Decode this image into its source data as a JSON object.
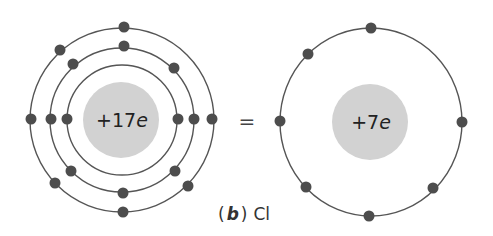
{
  "figure": {
    "caption": {
      "open_paren": "(",
      "part_letter": "b",
      "close_paren": ")",
      "element": "Cl"
    },
    "equals": "=",
    "left_atom": {
      "description": "Full chlorine atom with three electron shells",
      "nucleus_charge_prefix": "+17",
      "nucleus_charge_unit": "e",
      "shells": [
        {
          "name": "inner",
          "electrons": 2
        },
        {
          "name": "middle",
          "electrons": 8
        },
        {
          "name": "outer",
          "electrons": 7
        }
      ]
    },
    "right_atom": {
      "description": "Simplified chlorine atom showing only valence shell",
      "nucleus_charge_prefix": "+7",
      "nucleus_charge_unit": "e",
      "shells": [
        {
          "name": "valence",
          "electrons": 7
        }
      ]
    },
    "colors": {
      "nucleus": "#d2d2d2",
      "electron": "#4d4d4d",
      "shell": "#555555"
    }
  }
}
